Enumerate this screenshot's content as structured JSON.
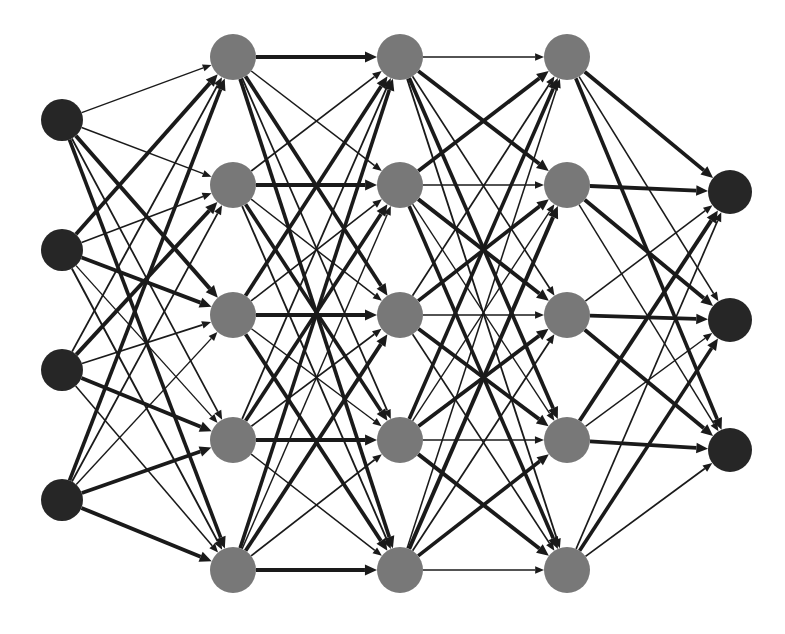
{
  "figure": {
    "kind": "neural-network-diagram",
    "background_color": "#ffffff",
    "width": 785,
    "height": 634
  },
  "style": {
    "input_node_color": "#262626",
    "hidden_node_color": "#787878",
    "output_node_color": "#262626",
    "edge_color": "#1a1a1a",
    "input_node_radius": 21,
    "hidden_node_radius": 23,
    "output_node_radius": 22,
    "arrow_length": 11,
    "arrow_half_width": 4.5,
    "min_edge_width": 0.7,
    "max_edge_width": 4.2
  },
  "layers": [
    {
      "name": "input-layer",
      "index": 0,
      "role": "input",
      "node_count": 4,
      "x": 62,
      "radius": 21,
      "color": "#262626",
      "node_ys": [
        120,
        250,
        370,
        500
      ]
    },
    {
      "name": "hidden-layer-1",
      "index": 1,
      "role": "hidden",
      "node_count": 5,
      "x": 233,
      "radius": 23,
      "color": "#787878",
      "node_ys": [
        57,
        185,
        315,
        440,
        570
      ]
    },
    {
      "name": "hidden-layer-2",
      "index": 2,
      "role": "hidden",
      "node_count": 5,
      "x": 400,
      "radius": 23,
      "color": "#787878",
      "node_ys": [
        57,
        185,
        315,
        440,
        570
      ]
    },
    {
      "name": "hidden-layer-3",
      "index": 3,
      "role": "hidden",
      "node_count": 5,
      "x": 567,
      "radius": 23,
      "color": "#787878",
      "node_ys": [
        57,
        185,
        315,
        440,
        570
      ]
    },
    {
      "name": "output-layer",
      "index": 4,
      "role": "output",
      "node_count": 3,
      "x": 730,
      "radius": 22,
      "color": "#262626",
      "node_ys": [
        192,
        320,
        450
      ]
    }
  ],
  "connections": [
    {
      "name": "input-to-hidden-1",
      "from_layer": 0,
      "to_layer": 1,
      "fully_connected": true,
      "weights": [
        [
          0.18,
          0.22,
          0.95,
          0.3,
          0.85
        ],
        [
          0.9,
          0.26,
          0.88,
          0.2,
          0.35
        ],
        [
          0.33,
          0.92,
          0.28,
          0.9,
          0.24
        ],
        [
          0.86,
          0.3,
          0.21,
          0.84,
          0.93
        ]
      ]
    },
    {
      "name": "hidden-1-to-hidden-2",
      "from_layer": 1,
      "to_layer": 2,
      "fully_connected": true,
      "weights": [
        [
          0.92,
          0.24,
          0.88,
          0.3,
          0.86
        ],
        [
          0.28,
          0.9,
          0.22,
          0.84,
          0.33
        ],
        [
          0.87,
          0.26,
          0.93,
          0.2,
          0.88
        ],
        [
          0.31,
          0.85,
          0.27,
          0.91,
          0.23
        ],
        [
          0.83,
          0.21,
          0.89,
          0.29,
          0.94
        ]
      ]
    },
    {
      "name": "hidden-2-to-hidden-3",
      "from_layer": 2,
      "to_layer": 3,
      "fully_connected": true,
      "weights": [
        [
          0.22,
          0.91,
          0.27,
          0.87,
          0.32
        ],
        [
          0.89,
          0.25,
          0.93,
          0.19,
          0.85
        ],
        [
          0.3,
          0.86,
          0.23,
          0.9,
          0.28
        ],
        [
          0.84,
          0.2,
          0.88,
          0.26,
          0.92
        ],
        [
          0.24,
          0.94,
          0.31,
          0.83,
          0.21
        ]
      ]
    },
    {
      "name": "hidden-3-to-output",
      "from_layer": 3,
      "to_layer": 4,
      "fully_connected": true,
      "weights": [
        [
          0.9,
          0.26,
          0.84
        ],
        [
          0.88,
          0.92,
          0.22
        ],
        [
          0.25,
          0.87,
          0.91
        ],
        [
          0.93,
          0.21,
          0.86
        ],
        [
          0.28,
          0.83,
          0.3
        ]
      ]
    }
  ]
}
